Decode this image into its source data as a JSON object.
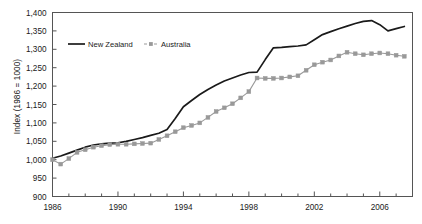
{
  "chart_data": {
    "type": "line",
    "title": "",
    "xlabel": "",
    "ylabel": "Index (1986 = 1000)",
    "xlim": [
      1986,
      2008
    ],
    "ylim": [
      900,
      1400
    ],
    "ytick_step": 50,
    "xtick_step": 4,
    "xminor_step": 1,
    "grid": false,
    "legend_position": "upper-left-inside",
    "ytick_labels": [
      "900",
      "950",
      "1,000",
      "1,050",
      "1,100",
      "1,150",
      "1,200",
      "1,250",
      "1,300",
      "1,350",
      "1,400"
    ],
    "ytick_values": [
      900,
      950,
      1000,
      1050,
      1100,
      1150,
      1200,
      1250,
      1300,
      1350,
      1400
    ],
    "xtick_labels": [
      "1986",
      "1990",
      "1994",
      "1998",
      "2002",
      "2006"
    ],
    "xtick_values": [
      1986,
      1990,
      1994,
      1998,
      2002,
      2006
    ],
    "xminor_values": [
      1987,
      1988,
      1989,
      1991,
      1992,
      1993,
      1995,
      1996,
      1997,
      1999,
      2000,
      2001,
      2003,
      2004,
      2005,
      2007,
      2008
    ],
    "x": [
      1986,
      1986.5,
      1987,
      1987.5,
      1988,
      1988.5,
      1989,
      1989.5,
      1990,
      1990.5,
      1991,
      1991.5,
      1992,
      1992.5,
      1993,
      1993.5,
      1994,
      1994.5,
      1995,
      1995.5,
      1996,
      1996.5,
      1997,
      1997.5,
      1998,
      1998.5,
      1999,
      1999.5,
      2000,
      2000.5,
      2001,
      2001.5,
      2002,
      2002.5,
      2003,
      2003.5,
      2004,
      2004.5,
      2005,
      2005.5,
      2006,
      2006.5,
      2007,
      2007.5
    ],
    "series": [
      {
        "name": "New Zealand",
        "color": "#1a1a1a",
        "style": "solid",
        "marker": "none",
        "values": [
          1004,
          1010,
          1018,
          1026,
          1034,
          1040,
          1043,
          1045,
          1046,
          1050,
          1055,
          1060,
          1066,
          1072,
          1082,
          1112,
          1144,
          1161,
          1177,
          1191,
          1203,
          1214,
          1222,
          1230,
          1237,
          1238,
          1272,
          1304,
          1305,
          1307,
          1309,
          1312,
          1326,
          1340,
          1348,
          1356,
          1363,
          1370,
          1376,
          1378,
          1367,
          1350,
          1356,
          1362
        ]
      },
      {
        "name": "Australia",
        "color": "#999999",
        "style": "dashed",
        "marker": "square",
        "values": [
          1000,
          988,
          1003,
          1020,
          1027,
          1034,
          1038,
          1041,
          1042,
          1042,
          1043,
          1044,
          1045,
          1055,
          1065,
          1076,
          1087,
          1093,
          1100,
          1115,
          1131,
          1141,
          1152,
          1168,
          1185,
          1222,
          1221,
          1221,
          1222,
          1225,
          1228,
          1243,
          1258,
          1265,
          1271,
          1282,
          1292,
          1288,
          1285,
          1288,
          1290,
          1288,
          1284,
          1281
        ]
      }
    ]
  },
  "legend": {
    "entries": [
      {
        "label": "New Zealand"
      },
      {
        "label": "Australia"
      }
    ]
  }
}
